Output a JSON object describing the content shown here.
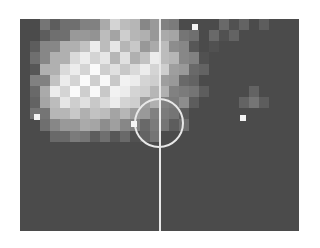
{
  "chart_data": {
    "type": "heatmap",
    "title": "",
    "grid": {
      "cols": 25,
      "rows": 19
    },
    "scale": {
      "min": 0,
      "max": 9,
      "low_color": "#4b4b4b",
      "high_color": "#f2f2f2"
    },
    "rows": [
      "2233344567765554222233323222",
      "2233456566776665432333222222",
      "2345677878776665432322222222",
      "2356788887877876543222222222",
      "2367888988888876543222222222",
      "2457889898988765432222222222",
      "2468898989887765433222232222",
      "2357888888876654432222333222",
      "2346777766665543322222222222",
      "2235566555544433322222222222",
      "2223443333333322222222222222",
      "2222222222222222222222222222",
      "2222222222222222222222222222",
      "2222222222222222222222222222",
      "2222222222222222222222222222",
      "2222222222222222222222222222",
      "2222222222222222222222222222",
      "2222222222222222222222222222",
      "2222222222222222222222222222"
    ],
    "bright_points": [
      {
        "x": 243,
        "y": 118
      },
      {
        "x": 134,
        "y": 124
      },
      {
        "x": 195,
        "y": 27
      },
      {
        "x": 37,
        "y": 117
      }
    ],
    "pitch": {
      "halfway_line": true,
      "centre_circle": true,
      "line_color": "#e8e8e8"
    },
    "legend": null,
    "axes": {
      "x": "",
      "y": ""
    }
  }
}
